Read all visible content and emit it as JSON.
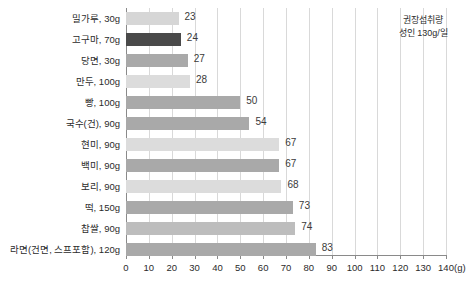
{
  "chart_data": {
    "type": "bar",
    "orientation": "horizontal",
    "title": "",
    "xlabel": "(g)",
    "ylabel": "",
    "xlim": [
      0,
      140
    ],
    "xticks": [
      0,
      10,
      20,
      30,
      40,
      50,
      60,
      70,
      80,
      90,
      100,
      110,
      120,
      130,
      140
    ],
    "unit": "(g)",
    "grid": true,
    "legend": "none",
    "categories": [
      "밀가루, 30g",
      "고구마, 70g",
      "당면, 30g",
      "만두, 100g",
      "빵, 100g",
      "국수(건), 90g",
      "현미, 90g",
      "백미, 90g",
      "보리, 90g",
      "떡, 150g",
      "찹쌀, 90g",
      "라면(건면, 스프포함), 120g"
    ],
    "values": [
      23,
      24,
      27,
      28,
      50,
      54,
      67,
      67,
      68,
      73,
      74,
      83
    ],
    "bar_colors": [
      "#d6d6d6",
      "#4a4a4a",
      "#a9a9a9",
      "#dcdcdc",
      "#a9a9a9",
      "#a9a9a9",
      "#dcdcdc",
      "#a9a9a9",
      "#dcdcdc",
      "#a9a9a9",
      "#bdbdbd",
      "#a9a9a9"
    ],
    "annotations": [
      {
        "name": "recommended-intake-note",
        "line1": "권장섭취량",
        "line2": "성인 130g/일",
        "x_position": 130
      }
    ]
  },
  "colors": {
    "axis": "#8a8a8a",
    "grid": "#d9d9d9",
    "text": "#2b2b2b",
    "value_text": "#3a3a3a",
    "background": "#ffffff"
  }
}
